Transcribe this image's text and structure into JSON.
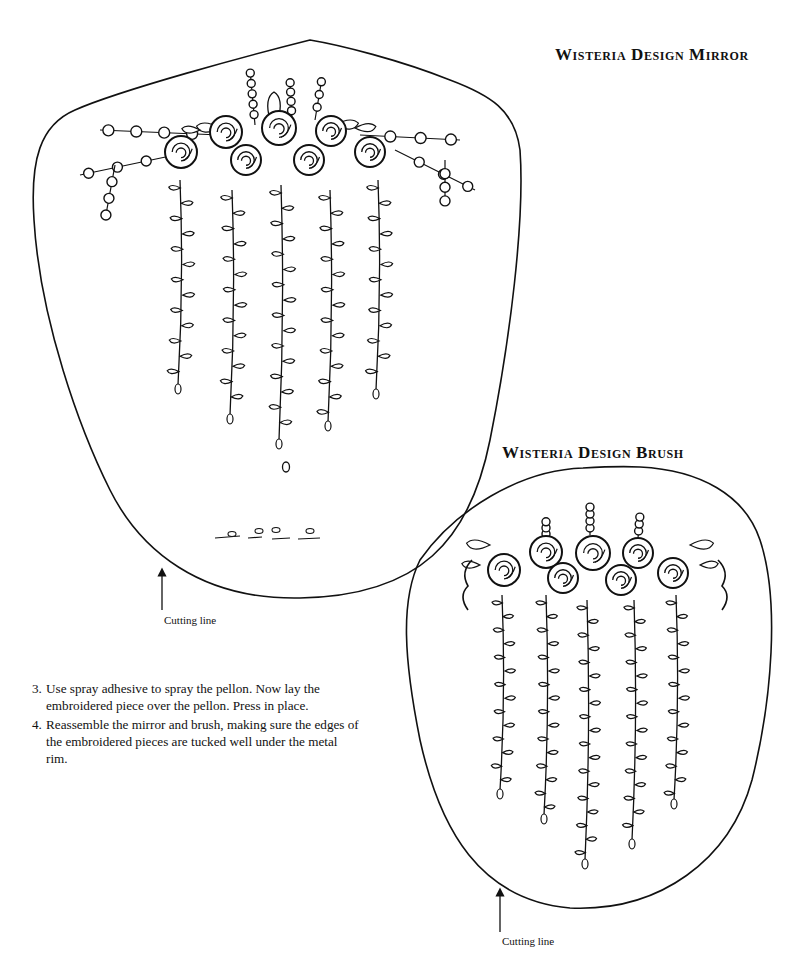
{
  "page": {
    "templates": [
      {
        "id": "mirror",
        "title": "Wisteria Design Mirror",
        "cutting_label": "Cutting line",
        "roses": 7,
        "hanging_vines": 5
      },
      {
        "id": "brush",
        "title": "Wisteria Design Brush",
        "cutting_label": "Cutting line",
        "roses": 7,
        "hanging_vines": 5
      }
    ],
    "instructions": [
      {
        "number": "3.",
        "text": "Use spray adhesive to spray the pellon. Now lay the embroidered piece over the pellon. Press in place."
      },
      {
        "number": "4.",
        "text": "Reassemble the mirror and brush, making sure the edges of the embroidered pieces are tucked well under the metal rim."
      }
    ]
  },
  "colors": {
    "ink": "#111111",
    "paper": "#ffffff"
  }
}
